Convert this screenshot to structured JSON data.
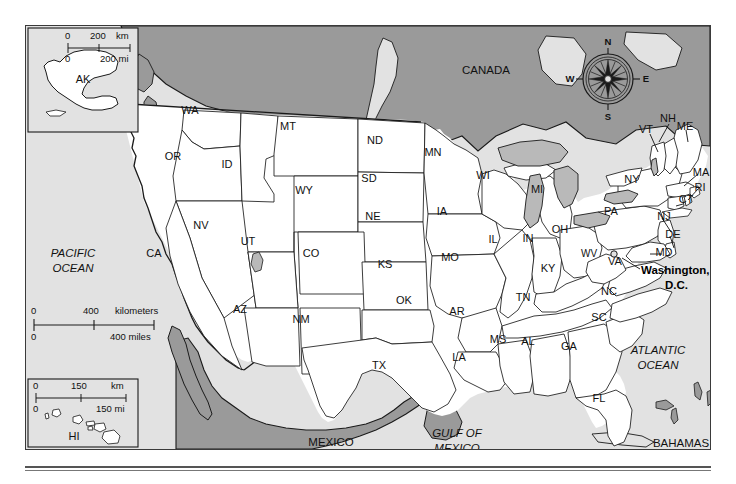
{
  "map": {
    "title": "United States reference map",
    "colors": {
      "ocean": "#e2e2e2",
      "foreign_land": "#9a9a9a",
      "us_land": "#ffffff",
      "lakes": "#b9b9b9",
      "border": "#1a1a1a",
      "text": "#111111"
    },
    "countries": [
      {
        "name": "CANADA",
        "x": 460,
        "y": 45,
        "italic": false
      },
      {
        "name": "MEXICO",
        "x": 305,
        "y": 417,
        "italic": false
      },
      {
        "name": "BAHAMAS",
        "x": 681,
        "y": 418,
        "italic": false
      }
    ],
    "oceans": [
      {
        "name": "PACIFIC",
        "x": 72,
        "y": 228
      },
      {
        "name": "OCEAN",
        "x": 72,
        "y": 243
      },
      {
        "name": "ATLANTIC",
        "x": 657,
        "y": 325
      },
      {
        "name": "OCEAN",
        "x": 657,
        "y": 340
      },
      {
        "name": "GULF OF",
        "x": 456,
        "y": 408
      },
      {
        "name": "MEXICO",
        "x": 456,
        "y": 423
      }
    ],
    "states": [
      {
        "code": "WA",
        "x": 189,
        "y": 110
      },
      {
        "code": "OR",
        "x": 172,
        "y": 156
      },
      {
        "code": "ID",
        "x": 226,
        "y": 164
      },
      {
        "code": "MT",
        "x": 287,
        "y": 126
      },
      {
        "code": "WY",
        "x": 303,
        "y": 190
      },
      {
        "code": "ND",
        "x": 374,
        "y": 140
      },
      {
        "code": "SD",
        "x": 368,
        "y": 178
      },
      {
        "code": "NE",
        "x": 372,
        "y": 216
      },
      {
        "code": "MN",
        "x": 432,
        "y": 152
      },
      {
        "code": "IA",
        "x": 441,
        "y": 211
      },
      {
        "code": "WI",
        "x": 482,
        "y": 175
      },
      {
        "code": "MI",
        "x": 536,
        "y": 189
      },
      {
        "code": "NV",
        "x": 200,
        "y": 225
      },
      {
        "code": "UT",
        "x": 247,
        "y": 241
      },
      {
        "code": "CO",
        "x": 310,
        "y": 253
      },
      {
        "code": "KS",
        "x": 384,
        "y": 264
      },
      {
        "code": "MO",
        "x": 449,
        "y": 257
      },
      {
        "code": "IL",
        "x": 492,
        "y": 239
      },
      {
        "code": "IN",
        "x": 527,
        "y": 238
      },
      {
        "code": "OH",
        "x": 559,
        "y": 229
      },
      {
        "code": "CA",
        "x": 153,
        "y": 253
      },
      {
        "code": "AZ",
        "x": 239,
        "y": 309
      },
      {
        "code": "NM",
        "x": 300,
        "y": 319
      },
      {
        "code": "OK",
        "x": 403,
        "y": 300
      },
      {
        "code": "AR",
        "x": 456,
        "y": 311
      },
      {
        "code": "TX",
        "x": 378,
        "y": 365
      },
      {
        "code": "LA",
        "x": 458,
        "y": 357
      },
      {
        "code": "MS",
        "x": 497,
        "y": 339
      },
      {
        "code": "AL",
        "x": 527,
        "y": 341
      },
      {
        "code": "GA",
        "x": 568,
        "y": 346
      },
      {
        "code": "FL",
        "x": 598,
        "y": 398
      },
      {
        "code": "SC",
        "x": 598,
        "y": 317
      },
      {
        "code": "NC",
        "x": 608,
        "y": 291
      },
      {
        "code": "TN",
        "x": 522,
        "y": 297
      },
      {
        "code": "KY",
        "x": 547,
        "y": 268
      },
      {
        "code": "WV",
        "x": 588,
        "y": 253
      },
      {
        "code": "VA",
        "x": 614,
        "y": 261
      },
      {
        "code": "PA",
        "x": 610,
        "y": 211
      },
      {
        "code": "NY",
        "x": 631,
        "y": 179
      }
    ],
    "callout_states": [
      {
        "code": "ME",
        "x": 684,
        "y": 126
      },
      {
        "code": "NH",
        "x": 667,
        "y": 118
      },
      {
        "code": "VT",
        "x": 645,
        "y": 129
      },
      {
        "code": "MA",
        "x": 700,
        "y": 172
      },
      {
        "code": "RI",
        "x": 699,
        "y": 187
      },
      {
        "code": "CT",
        "x": 685,
        "y": 199
      },
      {
        "code": "NJ",
        "x": 663,
        "y": 216
      },
      {
        "code": "DE",
        "x": 672,
        "y": 234
      },
      {
        "code": "MD",
        "x": 663,
        "y": 252
      }
    ],
    "city": {
      "name_line1": "Washington,",
      "name_line2": "D.C.",
      "label_x": 640,
      "label_y": 272,
      "marker_x": 613,
      "marker_y": 253
    },
    "compass": {
      "north": "N",
      "south": "S",
      "east": "E",
      "west": "W",
      "cx": 607,
      "cy": 78,
      "r": 25
    },
    "insets": [
      {
        "name": "alaska-inset",
        "label": "AK",
        "x": 28,
        "y": 28,
        "w": 108,
        "h": 103
      },
      {
        "name": "hawaii-inset",
        "label": "HI",
        "x": 28,
        "y": 378,
        "w": 108,
        "h": 68
      }
    ],
    "scalebars": [
      {
        "name": "alaska-scale",
        "top_zero": "0",
        "top_mid": "200",
        "top_unit": "km",
        "bottom_zero": "0",
        "bottom_label": "200 mi"
      },
      {
        "name": "main-scale",
        "top_zero": "0",
        "top_mid": "400",
        "top_unit": "kilometers",
        "bottom_zero": "0",
        "bottom_label": "400 miles"
      },
      {
        "name": "hawaii-scale",
        "top_zero": "0",
        "top_mid": "150",
        "top_unit": "km",
        "bottom_zero": "0",
        "bottom_label": "150 mi"
      }
    ]
  }
}
